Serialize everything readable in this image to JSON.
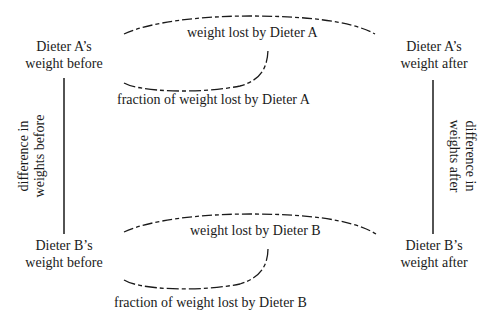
{
  "diagram": {
    "nodes": {
      "a_before": {
        "line1": "Dieter A’s",
        "line2": "weight before"
      },
      "a_after": {
        "line1": "Dieter A’s",
        "line2": "weight after"
      },
      "b_before": {
        "line1": "Dieter B’s",
        "line2": "weight before"
      },
      "b_after": {
        "line1": "Dieter B’s",
        "line2": "weight after"
      }
    },
    "arcs": {
      "a_lost": "weight lost by Dieter A",
      "a_fraction": "fraction of weight lost by Dieter A",
      "b_lost": "weight lost by Dieter B",
      "b_fraction": "fraction of weight lost by Dieter B"
    },
    "sides": {
      "left": {
        "line1": "difference in",
        "line2": "weights before"
      },
      "right": {
        "line1": "difference in",
        "line2": "weights after"
      }
    },
    "colors": {
      "ink": "#1a1a1a",
      "background": "#ffffff"
    }
  }
}
